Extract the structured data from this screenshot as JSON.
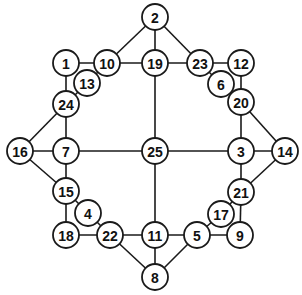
{
  "diagram": {
    "type": "graph",
    "node_radius": 13,
    "nodes": [
      {
        "id": "2",
        "x": 155,
        "y": 17
      },
      {
        "id": "1",
        "x": 66,
        "y": 63
      },
      {
        "id": "10",
        "x": 107,
        "y": 63
      },
      {
        "id": "19",
        "x": 155,
        "y": 63
      },
      {
        "id": "23",
        "x": 200,
        "y": 63
      },
      {
        "id": "12",
        "x": 241,
        "y": 63
      },
      {
        "id": "13",
        "x": 87,
        "y": 83
      },
      {
        "id": "6",
        "x": 221,
        "y": 84
      },
      {
        "id": "24",
        "x": 66,
        "y": 104
      },
      {
        "id": "20",
        "x": 241,
        "y": 102
      },
      {
        "id": "16",
        "x": 20,
        "y": 151
      },
      {
        "id": "7",
        "x": 66,
        "y": 151
      },
      {
        "id": "25",
        "x": 155,
        "y": 151
      },
      {
        "id": "3",
        "x": 241,
        "y": 151
      },
      {
        "id": "14",
        "x": 285,
        "y": 151
      },
      {
        "id": "15",
        "x": 66,
        "y": 191
      },
      {
        "id": "21",
        "x": 241,
        "y": 192
      },
      {
        "id": "4",
        "x": 88,
        "y": 213
      },
      {
        "id": "17",
        "x": 221,
        "y": 214
      },
      {
        "id": "18",
        "x": 66,
        "y": 235
      },
      {
        "id": "22",
        "x": 110,
        "y": 235
      },
      {
        "id": "11",
        "x": 155,
        "y": 235
      },
      {
        "id": "5",
        "x": 197,
        "y": 235
      },
      {
        "id": "9",
        "x": 240,
        "y": 235
      },
      {
        "id": "8",
        "x": 155,
        "y": 277
      }
    ],
    "edges": [
      [
        "2",
        "10"
      ],
      [
        "2",
        "19"
      ],
      [
        "2",
        "23"
      ],
      [
        "1",
        "10"
      ],
      [
        "10",
        "19"
      ],
      [
        "19",
        "23"
      ],
      [
        "23",
        "12"
      ],
      [
        "1",
        "24"
      ],
      [
        "10",
        "13"
      ],
      [
        "13",
        "24"
      ],
      [
        "23",
        "6"
      ],
      [
        "6",
        "20"
      ],
      [
        "12",
        "20"
      ],
      [
        "24",
        "16"
      ],
      [
        "24",
        "7"
      ],
      [
        "16",
        "7"
      ],
      [
        "7",
        "25"
      ],
      [
        "25",
        "3"
      ],
      [
        "3",
        "14"
      ],
      [
        "20",
        "3"
      ],
      [
        "20",
        "14"
      ],
      [
        "19",
        "25"
      ],
      [
        "25",
        "11"
      ],
      [
        "16",
        "15"
      ],
      [
        "7",
        "15"
      ],
      [
        "15",
        "18"
      ],
      [
        "15",
        "4"
      ],
      [
        "4",
        "22"
      ],
      [
        "18",
        "22"
      ],
      [
        "22",
        "11"
      ],
      [
        "22",
        "8"
      ],
      [
        "11",
        "8"
      ],
      [
        "11",
        "5"
      ],
      [
        "5",
        "8"
      ],
      [
        "5",
        "9"
      ],
      [
        "5",
        "17"
      ],
      [
        "17",
        "21"
      ],
      [
        "21",
        "9"
      ],
      [
        "3",
        "21"
      ],
      [
        "14",
        "21"
      ]
    ]
  }
}
